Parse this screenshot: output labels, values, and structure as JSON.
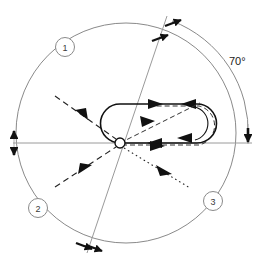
{
  "diagram": {
    "background_color": "#ffffff",
    "line_color": "#1a1a1a",
    "thin_line_color": "#8a8a8a",
    "callouts": [
      {
        "id": "1",
        "label": "1",
        "x": 65,
        "y": 47
      },
      {
        "id": "2",
        "label": "2",
        "x": 38,
        "y": 208
      },
      {
        "id": "3",
        "label": "3",
        "x": 213,
        "y": 201
      }
    ],
    "angle": {
      "label": "70°",
      "value": 70,
      "unit": "degrees",
      "x": 236,
      "y": 61
    },
    "center_node": {
      "name": "origin-node",
      "x": 120,
      "y": 143,
      "radius": 5,
      "fill": "#ffffff"
    },
    "outer_arc": {
      "cx": 132,
      "cy": 133,
      "r": 118
    },
    "inner_circle": {
      "cx": 126,
      "cy": 133,
      "r": 110
    },
    "loop": {
      "name": "racetrack-loop",
      "left_cap_x": 120,
      "right_cap_x": 197,
      "top_y": 104,
      "bottom_y": 143,
      "radius": 20
    },
    "reference_line": {
      "x1": 12,
      "y1": 143,
      "x2": 252,
      "y2": 143
    },
    "tilt_line": {
      "x1": 166,
      "y1": 17,
      "x2": 88,
      "y2": 252,
      "angle_deg": 71
    },
    "flow_arrows": [
      {
        "name": "incoming-dashed-upper",
        "style": "dashed",
        "direction": "down-right"
      },
      {
        "name": "incoming-dashed-lower",
        "style": "dashed",
        "direction": "up-right"
      },
      {
        "name": "outgoing-dotted",
        "style": "dotted",
        "direction": "down-right"
      },
      {
        "name": "loop-top-flow",
        "style": "solid",
        "direction": "right"
      },
      {
        "name": "loop-bottom-flow-left",
        "style": "solid",
        "direction": "left"
      },
      {
        "name": "loop-bottom-flow-right",
        "style": "solid",
        "direction": "right"
      },
      {
        "name": "loop-right-cap-flow",
        "style": "solid",
        "direction": "left"
      },
      {
        "name": "loop-diagonal-flow",
        "style": "dashed",
        "direction": "up-right"
      }
    ],
    "tick_marks": [
      {
        "name": "left-datum-tick",
        "x": 14,
        "y": 143
      },
      {
        "name": "right-datum-tick",
        "x": 248,
        "y": 136
      },
      {
        "name": "top-arc-tick",
        "x": 172,
        "y": 20
      },
      {
        "name": "top-inner-tick",
        "x": 160,
        "y": 38
      },
      {
        "name": "bottom-arc-tick",
        "x": 90,
        "y": 248
      },
      {
        "name": "bottom-inner-tick",
        "x": 80,
        "y": 243
      }
    ]
  }
}
